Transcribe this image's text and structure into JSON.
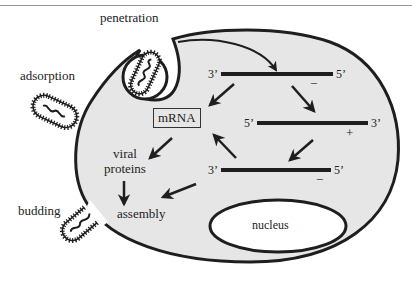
{
  "diagram": {
    "stages": {
      "penetration": "penetration",
      "adsorption": "adsorption",
      "budding": "budding",
      "assembly": "assembly"
    },
    "components": {
      "mrna": "mRNA",
      "viral_proteins_line1": "viral",
      "viral_proteins_line2": "proteins",
      "nucleus": "nucleus"
    },
    "strands": [
      {
        "left_end": "3’",
        "right_end": "5’",
        "sense": "−"
      },
      {
        "left_end": "5’",
        "right_end": "3’",
        "sense": "+"
      },
      {
        "left_end": "3’",
        "right_end": "5’",
        "sense": "−"
      }
    ],
    "colors": {
      "cell_fill": "#e6e6e6",
      "outline": "#1e1e1e",
      "nucleus_fill": "#ffffff",
      "background": "#ffffff"
    }
  }
}
